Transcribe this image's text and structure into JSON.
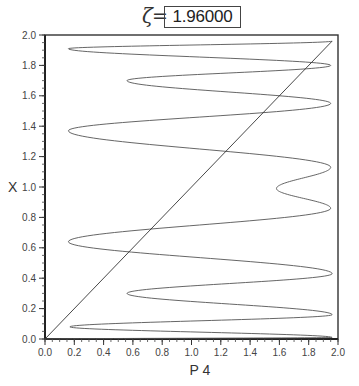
{
  "title": {
    "symbol": "ζ",
    "equals": "=",
    "value": "1.96000"
  },
  "chart_data": {
    "type": "line",
    "title": "ζ = 1.96000",
    "xlabel": "P 4",
    "ylabel": "X",
    "xlim": [
      0.0,
      2.0
    ],
    "ylim": [
      0.0,
      2.0
    ],
    "xticks": [
      "0.0",
      "0.2",
      "0.4",
      "0.6",
      "0.8",
      "1.0",
      "1.2",
      "1.4",
      "1.6",
      "1.8",
      "2.0"
    ],
    "yticks": [
      "0.0",
      "0.2",
      "0.4",
      "0.6",
      "0.8",
      "1.0",
      "1.2",
      "1.4",
      "1.6",
      "1.8",
      "2.0"
    ],
    "minor_tick_step": 0.05,
    "grid": false,
    "legend": null,
    "series": [
      {
        "name": "P4(X) curve",
        "note": "parametric oscillating curve, turning points (P4, X)",
        "points": [
          [
            0.0,
            0.0
          ],
          [
            1.96,
            0.01
          ],
          [
            0.17,
            0.08
          ],
          [
            1.96,
            0.16
          ],
          [
            0.56,
            0.3
          ],
          [
            1.96,
            0.43
          ],
          [
            0.16,
            0.64
          ],
          [
            1.95,
            0.86
          ],
          [
            1.58,
            0.99
          ],
          [
            1.95,
            1.13
          ],
          [
            0.16,
            1.37
          ],
          [
            1.95,
            1.55
          ],
          [
            0.56,
            1.7
          ],
          [
            1.95,
            1.8
          ],
          [
            0.16,
            1.91
          ],
          [
            1.96,
            1.96
          ]
        ]
      },
      {
        "name": "identity line",
        "points": [
          [
            0.0,
            0.0
          ],
          [
            1.96,
            1.96
          ]
        ]
      }
    ]
  }
}
